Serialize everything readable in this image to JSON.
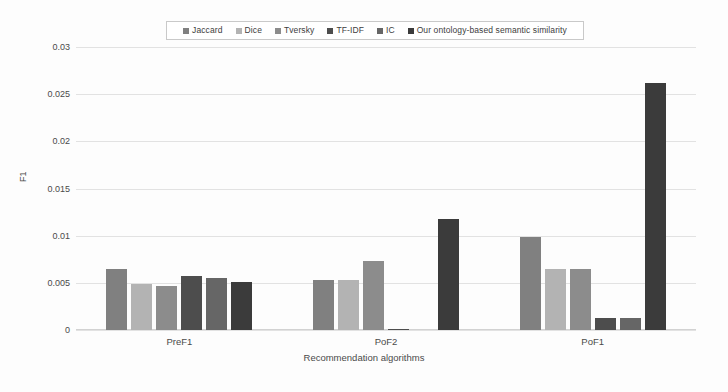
{
  "chart_data": {
    "type": "bar",
    "title": "",
    "xlabel": "Recommendation algorithms",
    "ylabel": "F1",
    "categories": [
      "PreF1",
      "PoF2",
      "PoF1"
    ],
    "ylim": [
      0,
      0.03
    ],
    "yticks": [
      "0",
      "0.005",
      "0.01",
      "0.015",
      "0.02",
      "0.025",
      "0.03"
    ],
    "ytick_values": [
      0,
      0.005,
      0.01,
      0.015,
      0.02,
      0.025,
      0.03
    ],
    "grid": true,
    "legend_position": "top-center",
    "series": [
      {
        "name": "Jaccard",
        "color": "#808080",
        "values": [
          0.0065,
          0.0053,
          0.0099
        ]
      },
      {
        "name": "Dice",
        "color": "#b3b3b3",
        "values": [
          0.0049,
          0.0053,
          0.0065
        ]
      },
      {
        "name": "Tversky",
        "color": "#8c8c8c",
        "values": [
          0.0047,
          0.0073,
          0.0065
        ]
      },
      {
        "name": "TF-IDF",
        "color": "#4d4d4d",
        "values": [
          0.0057,
          0.0001,
          0.0013
        ]
      },
      {
        "name": "IC",
        "color": "#666666",
        "values": [
          0.0055,
          0.0,
          0.0013
        ]
      },
      {
        "name": "Our ontology-based semantic similarity",
        "color": "#3b3b3b",
        "values": [
          0.0051,
          0.0118,
          0.0262
        ]
      }
    ]
  }
}
